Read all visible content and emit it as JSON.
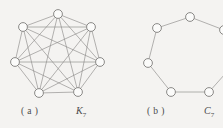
{
  "figure": {
    "background_color": "#f4f3f1",
    "edge_color": "#8d8b89",
    "vertex_fill": "#fbfbfa",
    "vertex_stroke": "#6f6d6b",
    "panels": [
      {
        "index_label": "( a )",
        "graph_name": "K",
        "graph_subscript": "7",
        "graph_type": "complete",
        "vertex_count": 7,
        "edge_count": 21,
        "vertex_radius": 4.4,
        "vertices": [
          {
            "id": 0,
            "x": 58,
            "y": 14
          },
          {
            "id": 1,
            "x": 91,
            "y": 27
          },
          {
            "id": 2,
            "x": 100,
            "y": 62
          },
          {
            "id": 3,
            "x": 78,
            "y": 92
          },
          {
            "id": 4,
            "x": 39,
            "y": 93
          },
          {
            "id": 5,
            "x": 15,
            "y": 62
          },
          {
            "id": 6,
            "x": 23,
            "y": 27
          }
        ],
        "edges": [
          [
            0,
            1
          ],
          [
            0,
            2
          ],
          [
            0,
            3
          ],
          [
            0,
            4
          ],
          [
            0,
            5
          ],
          [
            0,
            6
          ],
          [
            1,
            2
          ],
          [
            1,
            3
          ],
          [
            1,
            4
          ],
          [
            1,
            5
          ],
          [
            1,
            6
          ],
          [
            2,
            3
          ],
          [
            2,
            4
          ],
          [
            2,
            5
          ],
          [
            2,
            6
          ],
          [
            3,
            4
          ],
          [
            3,
            5
          ],
          [
            3,
            6
          ],
          [
            4,
            5
          ],
          [
            4,
            6
          ],
          [
            5,
            6
          ]
        ]
      },
      {
        "index_label": "( b )",
        "graph_name": "C",
        "graph_subscript": "7",
        "graph_type": "cycle",
        "vertex_count": 7,
        "edge_count": 7,
        "vertex_radius": 4.4,
        "clipped_right_edge": true,
        "vertices": [
          {
            "id": 0,
            "x": 190,
            "y": 17
          },
          {
            "id": 1,
            "x": 224,
            "y": 30
          },
          {
            "id": 2,
            "x": 233,
            "y": 65
          },
          {
            "id": 3,
            "x": 209,
            "y": 92
          },
          {
            "id": 4,
            "x": 171,
            "y": 92
          },
          {
            "id": 5,
            "x": 148,
            "y": 63
          },
          {
            "id": 6,
            "x": 157,
            "y": 28
          }
        ],
        "edges": [
          [
            0,
            1
          ],
          [
            1,
            2
          ],
          [
            2,
            3
          ],
          [
            3,
            4
          ],
          [
            4,
            5
          ],
          [
            5,
            6
          ],
          [
            6,
            0
          ]
        ]
      }
    ]
  }
}
